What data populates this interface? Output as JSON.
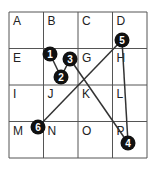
{
  "grid": {
    "rows": 4,
    "cols": 4,
    "x0": 9,
    "y0": 12,
    "cell_w": 34.5,
    "cell_h": 36.5,
    "labels": [
      "A",
      "B",
      "C",
      "D",
      "E",
      "F",
      "G",
      "H",
      "I",
      "J",
      "K",
      "L",
      "M",
      "N",
      "O",
      "P"
    ],
    "hidden_labels": [
      "F"
    ]
  },
  "points": [
    {
      "id": "1",
      "x": 50,
      "y": 54
    },
    {
      "id": "2",
      "x": 61,
      "y": 77
    },
    {
      "id": "3",
      "x": 70,
      "y": 59
    },
    {
      "id": "4",
      "x": 128,
      "y": 143
    },
    {
      "id": "5",
      "x": 122,
      "y": 40
    },
    {
      "id": "6",
      "x": 38,
      "y": 127
    }
  ],
  "path": [
    "1",
    "2",
    "3",
    "4",
    "5",
    "6"
  ],
  "colors": {
    "line": "#333333",
    "marker": "#111111",
    "grid": "#555555"
  }
}
